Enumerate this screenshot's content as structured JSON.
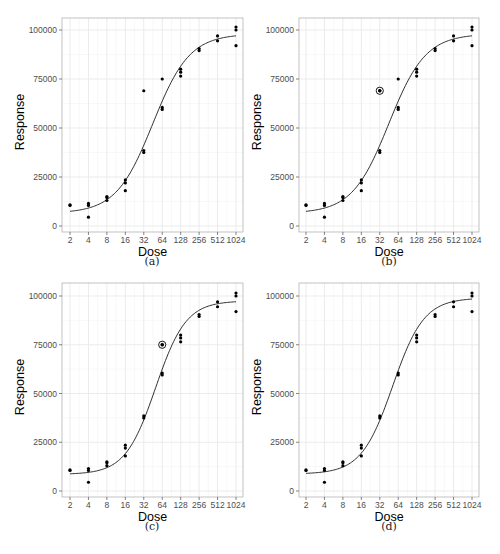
{
  "chart_data": [
    {
      "type": "scatter",
      "panel": "a",
      "caption": "(a)",
      "xlabel": "Dose",
      "ylabel": "Response",
      "x_scale": "log2",
      "x_ticks": [
        2,
        4,
        8,
        16,
        32,
        64,
        128,
        256,
        512,
        1024
      ],
      "y_ticks": [
        0,
        25000,
        50000,
        75000,
        100000
      ],
      "ylim": [
        0,
        105000
      ],
      "grid": true,
      "points": [
        {
          "x": 2,
          "y": 10800
        },
        {
          "x": 2,
          "y": 10500
        },
        {
          "x": 4,
          "y": 11500
        },
        {
          "x": 4,
          "y": 10500
        },
        {
          "x": 4,
          "y": 4500
        },
        {
          "x": 8,
          "y": 15000
        },
        {
          "x": 8,
          "y": 14500
        },
        {
          "x": 8,
          "y": 13000
        },
        {
          "x": 16,
          "y": 23500
        },
        {
          "x": 16,
          "y": 22000
        },
        {
          "x": 16,
          "y": 18000
        },
        {
          "x": 32,
          "y": 69000
        },
        {
          "x": 32,
          "y": 38500
        },
        {
          "x": 32,
          "y": 37500
        },
        {
          "x": 64,
          "y": 75000
        },
        {
          "x": 64,
          "y": 60500
        },
        {
          "x": 64,
          "y": 59500
        },
        {
          "x": 128,
          "y": 80000
        },
        {
          "x": 128,
          "y": 78500
        },
        {
          "x": 128,
          "y": 76500
        },
        {
          "x": 256,
          "y": 90500
        },
        {
          "x": 256,
          "y": 89500
        },
        {
          "x": 512,
          "y": 97000
        },
        {
          "x": 512,
          "y": 94500
        },
        {
          "x": 1024,
          "y": 101500
        },
        {
          "x": 1024,
          "y": 100000
        },
        {
          "x": 1024,
          "y": 92000
        }
      ],
      "highlighted": [],
      "fit_curve": {
        "model": "4-parameter logistic",
        "bottom": 6500,
        "top": 98000,
        "ec50": 45,
        "hill": 1.45
      }
    },
    {
      "type": "scatter",
      "panel": "b",
      "caption": "(b)",
      "xlabel": "Dose",
      "ylabel": "Response",
      "x_scale": "log2",
      "x_ticks": [
        2,
        4,
        8,
        16,
        32,
        64,
        128,
        256,
        512,
        1024
      ],
      "y_ticks": [
        0,
        25000,
        50000,
        75000,
        100000
      ],
      "ylim": [
        0,
        105000
      ],
      "grid": true,
      "points": [
        {
          "x": 2,
          "y": 10800
        },
        {
          "x": 2,
          "y": 10500
        },
        {
          "x": 4,
          "y": 11500
        },
        {
          "x": 4,
          "y": 10500
        },
        {
          "x": 4,
          "y": 4500
        },
        {
          "x": 8,
          "y": 15000
        },
        {
          "x": 8,
          "y": 14500
        },
        {
          "x": 8,
          "y": 13000
        },
        {
          "x": 16,
          "y": 23500
        },
        {
          "x": 16,
          "y": 22000
        },
        {
          "x": 16,
          "y": 18000
        },
        {
          "x": 32,
          "y": 69000
        },
        {
          "x": 32,
          "y": 38500
        },
        {
          "x": 32,
          "y": 37500
        },
        {
          "x": 64,
          "y": 75000
        },
        {
          "x": 64,
          "y": 60500
        },
        {
          "x": 64,
          "y": 59500
        },
        {
          "x": 128,
          "y": 80000
        },
        {
          "x": 128,
          "y": 78500
        },
        {
          "x": 128,
          "y": 76500
        },
        {
          "x": 256,
          "y": 90500
        },
        {
          "x": 256,
          "y": 89500
        },
        {
          "x": 512,
          "y": 97000
        },
        {
          "x": 512,
          "y": 94500
        },
        {
          "x": 1024,
          "y": 101500
        },
        {
          "x": 1024,
          "y": 100000
        },
        {
          "x": 1024,
          "y": 92000
        }
      ],
      "highlighted": [
        {
          "x": 32,
          "y": 69000
        }
      ],
      "fit_curve": {
        "model": "4-parameter logistic",
        "bottom": 6500,
        "top": 98000,
        "ec50": 45,
        "hill": 1.45
      }
    },
    {
      "type": "scatter",
      "panel": "c",
      "caption": "(c)",
      "xlabel": "Dose",
      "ylabel": "Response",
      "x_scale": "log2",
      "x_ticks": [
        2,
        4,
        8,
        16,
        32,
        64,
        128,
        256,
        512,
        1024
      ],
      "y_ticks": [
        0,
        25000,
        50000,
        75000,
        100000
      ],
      "ylim": [
        0,
        105000
      ],
      "grid": true,
      "points": [
        {
          "x": 2,
          "y": 10800
        },
        {
          "x": 2,
          "y": 10500
        },
        {
          "x": 4,
          "y": 11500
        },
        {
          "x": 4,
          "y": 10500
        },
        {
          "x": 4,
          "y": 4500
        },
        {
          "x": 8,
          "y": 15000
        },
        {
          "x": 8,
          "y": 14500
        },
        {
          "x": 8,
          "y": 13000
        },
        {
          "x": 16,
          "y": 23500
        },
        {
          "x": 16,
          "y": 22000
        },
        {
          "x": 16,
          "y": 18000
        },
        {
          "x": 32,
          "y": 38500
        },
        {
          "x": 32,
          "y": 37500
        },
        {
          "x": 64,
          "y": 75000
        },
        {
          "x": 64,
          "y": 60500
        },
        {
          "x": 64,
          "y": 59500
        },
        {
          "x": 128,
          "y": 80000
        },
        {
          "x": 128,
          "y": 78500
        },
        {
          "x": 128,
          "y": 76500
        },
        {
          "x": 256,
          "y": 90500
        },
        {
          "x": 256,
          "y": 89500
        },
        {
          "x": 512,
          "y": 97000
        },
        {
          "x": 512,
          "y": 94500
        },
        {
          "x": 1024,
          "y": 101500
        },
        {
          "x": 1024,
          "y": 100000
        },
        {
          "x": 1024,
          "y": 92000
        }
      ],
      "highlighted": [
        {
          "x": 64,
          "y": 75000
        }
      ],
      "fit_curve": {
        "model": "4-parameter logistic",
        "bottom": 8500,
        "top": 97500,
        "ec50": 50,
        "hill": 1.75
      }
    },
    {
      "type": "scatter",
      "panel": "d",
      "caption": "(d)",
      "xlabel": "Dose",
      "ylabel": "Response",
      "x_scale": "log2",
      "x_ticks": [
        2,
        4,
        8,
        16,
        32,
        64,
        128,
        256,
        512,
        1024
      ],
      "y_ticks": [
        0,
        25000,
        50000,
        75000,
        100000
      ],
      "ylim": [
        0,
        105000
      ],
      "grid": true,
      "points": [
        {
          "x": 2,
          "y": 10800
        },
        {
          "x": 2,
          "y": 10500
        },
        {
          "x": 4,
          "y": 11500
        },
        {
          "x": 4,
          "y": 10500
        },
        {
          "x": 4,
          "y": 4500
        },
        {
          "x": 8,
          "y": 15000
        },
        {
          "x": 8,
          "y": 14500
        },
        {
          "x": 8,
          "y": 13000
        },
        {
          "x": 16,
          "y": 23500
        },
        {
          "x": 16,
          "y": 22000
        },
        {
          "x": 16,
          "y": 18000
        },
        {
          "x": 32,
          "y": 38500
        },
        {
          "x": 32,
          "y": 37500
        },
        {
          "x": 64,
          "y": 60500
        },
        {
          "x": 64,
          "y": 59500
        },
        {
          "x": 128,
          "y": 80000
        },
        {
          "x": 128,
          "y": 78500
        },
        {
          "x": 128,
          "y": 76500
        },
        {
          "x": 256,
          "y": 90500
        },
        {
          "x": 256,
          "y": 89500
        },
        {
          "x": 512,
          "y": 97000
        },
        {
          "x": 512,
          "y": 94500
        },
        {
          "x": 1024,
          "y": 101500
        },
        {
          "x": 1024,
          "y": 100000
        },
        {
          "x": 1024,
          "y": 92000
        }
      ],
      "highlighted": [],
      "fit_curve": {
        "model": "4-parameter logistic",
        "bottom": 8700,
        "top": 99000,
        "ec50": 52,
        "hill": 1.7
      }
    }
  ],
  "colors": {
    "point": "#000000",
    "curve": "#1a1a1a",
    "grid_major": "#ebebeb",
    "grid_minor": "#f4f4f4",
    "frame": "#b3b3b3",
    "tick_text": "#4d4d4d"
  }
}
